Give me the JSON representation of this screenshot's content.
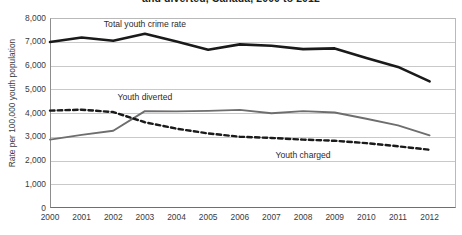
{
  "chart_data": {
    "type": "line",
    "title": "and diverted, Canada, 2000 to 2012",
    "xlabel": "",
    "ylabel": "Rate per 100,000 youth population",
    "categories": [
      "2000",
      "2001",
      "2002",
      "2003",
      "2004",
      "2005",
      "2006",
      "2007",
      "2008",
      "2009",
      "2010",
      "2011",
      "2012"
    ],
    "x": [
      2000,
      2001,
      2002,
      2003,
      2004,
      2005,
      2006,
      2007,
      2008,
      2009,
      2010,
      2011,
      2012
    ],
    "ylim": [
      0,
      8000
    ],
    "xlim": [
      2000,
      2012
    ],
    "grid": "horizontal",
    "legend_position": "inline-labels",
    "y_ticks": [
      0,
      1000,
      2000,
      3000,
      4000,
      5000,
      6000,
      7000,
      8000
    ],
    "y_tick_labels": [
      "0",
      "1,000",
      "2,000",
      "3,000",
      "4,000",
      "5,000",
      "6,000",
      "7,000",
      "8,000"
    ],
    "series": [
      {
        "name": "Total youth crime rate",
        "style": "solid-black-thick",
        "color": "#1a1a1a",
        "values": [
          6990,
          7180,
          7040,
          7340,
          7010,
          6660,
          6890,
          6830,
          6690,
          6720,
          6320,
          5940,
          5330
        ]
      },
      {
        "name": "Youth diverted",
        "style": "solid-gray",
        "color": "#6e6e6e",
        "values": [
          2880,
          3080,
          3250,
          4080,
          4070,
          4090,
          4130,
          3990,
          4080,
          4020,
          3760,
          3480,
          3060
        ]
      },
      {
        "name": "Youth charged",
        "style": "dashed-black",
        "color": "#1a1a1a",
        "values": [
          4100,
          4140,
          4040,
          3610,
          3340,
          3140,
          3000,
          2950,
          2880,
          2830,
          2730,
          2600,
          2450
        ]
      }
    ],
    "annotations": [
      {
        "text": "Total youth crime rate",
        "x": 2003.0,
        "y": 7720
      },
      {
        "text": "Youth diverted",
        "x": 2003.0,
        "y": 4640
      },
      {
        "text": "Youth charged",
        "x": 2008.0,
        "y": 2190
      }
    ]
  }
}
